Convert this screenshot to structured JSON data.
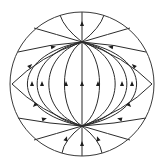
{
  "colors": {
    "stroke": "#2b2b2b",
    "boundary": "#3a3a3a",
    "arrow": "#1e1e1e",
    "background": "#ffffff"
  },
  "diagram": {
    "type": "phase-portrait",
    "nodes": [
      {
        "id": "top-node",
        "role": "sink"
      },
      {
        "id": "bottom-node",
        "role": "source"
      }
    ],
    "boundary_vertices": [
      {
        "id": "left-vertex"
      },
      {
        "id": "right-vertex"
      }
    ],
    "flow_direction": "upward (from bottom node toward top node)"
  }
}
